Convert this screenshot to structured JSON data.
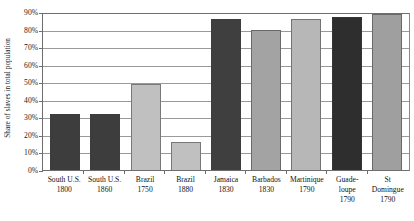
{
  "chart_data": {
    "type": "bar",
    "title": "",
    "xlabel": "",
    "ylabel": "Share of slaves in total population",
    "ylim": [
      0,
      90
    ],
    "grid": true,
    "legend_position": "none",
    "ytick_labels": [
      "90%",
      "80%",
      "70%",
      "60%",
      "50%",
      "40%",
      "30%",
      "20%",
      "10%",
      "0%"
    ],
    "ytick_values": [
      90,
      80,
      70,
      60,
      50,
      40,
      30,
      20,
      10,
      0
    ],
    "categories": [
      "South U.S.",
      "South U.S.",
      "Brazil",
      "Brazil",
      "Jamaica",
      "Barbados",
      "Martinique",
      "Guade-\nloupe",
      "St\nDomingue"
    ],
    "years": [
      "1800",
      "1860",
      "1750",
      "1880",
      "1830",
      "1830",
      "1790",
      "1790",
      "1790"
    ],
    "values": [
      32,
      32,
      49,
      16,
      86,
      80,
      86,
      87,
      89
    ],
    "bar_colors": [
      "#3d3d3d",
      "#3d3d3d",
      "#c0c0c0",
      "#c0c0c0",
      "#3f3f3f",
      "#a3a3a3",
      "#b7b7b7",
      "#2e2e2e",
      "#9f9f9f"
    ],
    "bars": [
      {
        "label": "South U.S.",
        "year": "1800",
        "value": 32,
        "color": "#3d3d3d"
      },
      {
        "label": "South U.S.",
        "year": "1860",
        "value": 32,
        "color": "#3d3d3d"
      },
      {
        "label": "Brazil",
        "year": "1750",
        "value": 49,
        "color": "#c0c0c0"
      },
      {
        "label": "Brazil",
        "year": "1880",
        "value": 16,
        "color": "#c0c0c0"
      },
      {
        "label": "Jamaica",
        "year": "1830",
        "value": 86,
        "color": "#3f3f3f"
      },
      {
        "label": "Barbados",
        "year": "1830",
        "value": 80,
        "color": "#a3a3a3"
      },
      {
        "label": "Martinique",
        "year": "1790",
        "value": 86,
        "color": "#b7b7b7"
      },
      {
        "label": "Guade-\nloupe",
        "year": "1790",
        "value": 87,
        "color": "#2e2e2e"
      },
      {
        "label": "St\nDomingue",
        "year": "1790",
        "value": 89,
        "color": "#9f9f9f"
      }
    ]
  }
}
